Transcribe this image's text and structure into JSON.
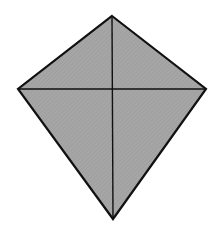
{
  "diagram": {
    "shape": "kite",
    "vertices": {
      "top": [
        112,
        16
      ],
      "left": [
        18,
        89
      ],
      "right": [
        206,
        89
      ],
      "bottom": [
        113,
        219
      ]
    },
    "fill_color": "#a3a3a3",
    "stroke_color": "#111111",
    "outline_width": 2.2,
    "diagonal_width": 1.4,
    "diagonals": [
      {
        "from": "top",
        "to": "bottom"
      },
      {
        "from": "left",
        "to": "right"
      }
    ]
  }
}
